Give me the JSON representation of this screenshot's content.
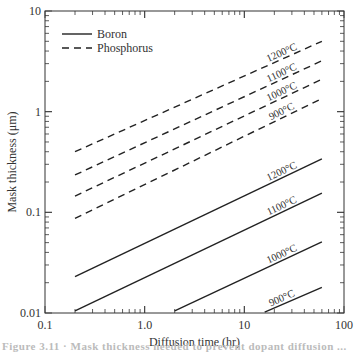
{
  "chart_data": {
    "type": "line",
    "title": "",
    "xlabel": "Diffusion time (hr)",
    "ylabel": "Mask thickness (μm)",
    "xscale": "log",
    "yscale": "log",
    "xlim": [
      0.1,
      100
    ],
    "ylim": [
      0.01,
      10
    ],
    "x_ticks": [
      "0.1",
      "1.0",
      "10",
      "100"
    ],
    "y_ticks": [
      "10",
      "1",
      "0.1",
      "0.01"
    ],
    "grid": false,
    "legend": {
      "position": "upper left",
      "entries": [
        {
          "label": "Boron",
          "style": "solid"
        },
        {
          "label": "Phosphorus",
          "style": "dashed"
        }
      ]
    },
    "series": [
      {
        "name": "Phosphorus 1200°C",
        "dopant": "Phosphorus",
        "temp_label": "1200°C",
        "style": "dashed",
        "x": [
          0.2,
          60
        ],
        "y": [
          0.4,
          5.0
        ]
      },
      {
        "name": "Phosphorus 1100°C",
        "dopant": "Phosphorus",
        "temp_label": "1100°C",
        "style": "dashed",
        "x": [
          0.2,
          60
        ],
        "y": [
          0.235,
          3.2
        ]
      },
      {
        "name": "Phosphorus 1000°C",
        "dopant": "Phosphorus",
        "temp_label": "1000°C",
        "style": "dashed",
        "x": [
          0.2,
          60
        ],
        "y": [
          0.145,
          2.1
        ]
      },
      {
        "name": "Phosphorus 900°C",
        "dopant": "Phosphorus",
        "temp_label": "900°C",
        "style": "dashed",
        "x": [
          0.2,
          60
        ],
        "y": [
          0.087,
          1.35
        ]
      },
      {
        "name": "Boron 1200°C",
        "dopant": "Boron",
        "temp_label": "1200°C",
        "style": "solid",
        "x": [
          0.2,
          60
        ],
        "y": [
          0.023,
          0.34
        ]
      },
      {
        "name": "Boron 1100°C",
        "dopant": "Boron",
        "temp_label": "1100°C",
        "style": "solid",
        "x": [
          0.2,
          60
        ],
        "y": [
          0.0105,
          0.155
        ]
      },
      {
        "name": "Boron 1000°C",
        "dopant": "Boron",
        "temp_label": "1000°C",
        "style": "solid",
        "x": [
          2.0,
          60
        ],
        "y": [
          0.0105,
          0.051
        ]
      },
      {
        "name": "Boron 900°C",
        "dopant": "Boron",
        "temp_label": "900°C",
        "style": "solid",
        "x": [
          16,
          60
        ],
        "y": [
          0.0102,
          0.018
        ]
      }
    ]
  },
  "caption": "Figure 3.11  ·  Mask thickness needed to prevent dopant diffusion ..."
}
